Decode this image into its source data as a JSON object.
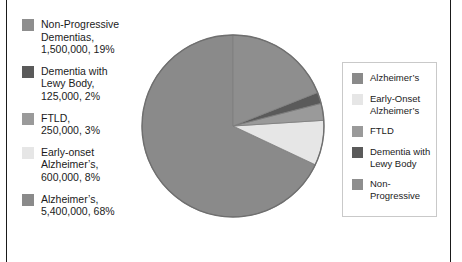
{
  "figure": {
    "name": "dementia-prevalence-pie-chart"
  },
  "colors": {
    "alzheimers": "#8a8a8a",
    "early_onset_alzheimers": "#e6e6e6",
    "ftld": "#9a9a9a",
    "dementia_with_lewy_body": "#5a5a5a",
    "non_progressive": "#8e8e8e",
    "slice_outline": "#6f6f6f",
    "legend_border": "#c9c9c9",
    "frame_rule": "#1a1a1a",
    "text": "#1b1b1b",
    "background": "#ffffff"
  },
  "data_labels": [
    {
      "key": "non-progressive",
      "swatch": "#8e8e8e",
      "line1": "Non-Progressive",
      "line2": "Dementias,",
      "line3": "1,500,000, 19%"
    },
    {
      "key": "dementia-with-lewy-body",
      "swatch": "#5a5a5a",
      "line1": "Dementia with",
      "line2": "Lewy Body,",
      "line3": "125,000, 2%"
    },
    {
      "key": "ftld",
      "swatch": "#9a9a9a",
      "line1": "FTLD,",
      "line2": "250,000, 3%",
      "line3": ""
    },
    {
      "key": "early-onset-alzheimers",
      "swatch": "#e6e6e6",
      "line1": "Early-onset",
      "line2": "Alzheimer’s,",
      "line3": "600,000, 8%"
    },
    {
      "key": "alzheimers",
      "swatch": "#8a8a8a",
      "line1": "Alzheimer’s,",
      "line2": "5,400,000, 68%",
      "line3": ""
    }
  ],
  "legend": {
    "items": [
      {
        "key": "alzheimers",
        "swatch": "#8a8a8a",
        "line1": "Alzheimer’s",
        "line2": ""
      },
      {
        "key": "early-onset-alzheimers",
        "swatch": "#e6e6e6",
        "line1": "Early-Onset",
        "line2": "Alzheimer’s"
      },
      {
        "key": "ftld",
        "swatch": "#9a9a9a",
        "line1": "FTLD",
        "line2": ""
      },
      {
        "key": "dementia-with-lewy-body",
        "swatch": "#5a5a5a",
        "line1": "Dementia with",
        "line2": "Lewy Body"
      },
      {
        "key": "non-progressive",
        "swatch": "#8e8e8e",
        "line1": "Non-Progressive",
        "line2": ""
      }
    ]
  },
  "chart_data": {
    "type": "pie",
    "title": "",
    "xlabel": "",
    "ylabel": "",
    "legend_position": "right",
    "grid": false,
    "start_angle_deg": 90,
    "direction": "counterclockwise",
    "center": {
      "x": 93,
      "y": 93
    },
    "radius": 91,
    "total": 7875000,
    "labels": [
      "Alzheimer’s",
      "Early-Onset Alzheimer’s",
      "FTLD",
      "Dementia with Lewy Body",
      "Non-Progressive"
    ],
    "values": [
      5400000,
      600000,
      250000,
      125000,
      1500000
    ],
    "percentages": [
      68,
      8,
      3,
      2,
      19
    ],
    "value_labels": [
      "5,400,000",
      "600,000",
      "250,000",
      "125,000",
      "1,500,000"
    ],
    "percent_labels": [
      "68%",
      "8%",
      "3%",
      "2%",
      "19%"
    ],
    "slice_colors": [
      "#8a8a8a",
      "#e6e6e6",
      "#9a9a9a",
      "#5a5a5a",
      "#8e8e8e"
    ],
    "slices": [
      {
        "label": "Alzheimer’s",
        "value": 5400000,
        "percent": 68,
        "color": "#8a8a8a"
      },
      {
        "label": "Early-Onset Alzheimer’s",
        "value": 600000,
        "percent": 8,
        "color": "#e6e6e6"
      },
      {
        "label": "FTLD",
        "value": 250000,
        "percent": 3,
        "color": "#9a9a9a"
      },
      {
        "label": "Dementia with Lewy Body",
        "value": 125000,
        "percent": 2,
        "color": "#5a5a5a"
      },
      {
        "label": "Non-Progressive",
        "value": 1500000,
        "percent": 19,
        "color": "#8e8e8e"
      }
    ]
  }
}
